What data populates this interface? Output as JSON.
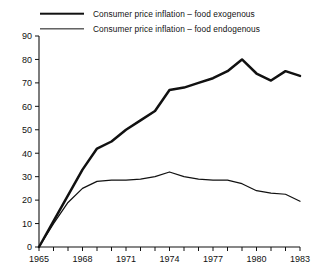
{
  "legend": {
    "position": "top",
    "items": [
      {
        "label": "Consumer price inflation – food exogenous",
        "style": "thick"
      },
      {
        "label": "Consumer price inflation – food endogenous",
        "style": "thin"
      }
    ]
  },
  "chart_data": {
    "type": "line",
    "title": "",
    "xlabel": "",
    "ylabel": "",
    "xlim": [
      1965,
      1983
    ],
    "ylim": [
      0,
      90
    ],
    "grid": false,
    "legend_position": "top",
    "ytick_labels": [
      "0",
      "10",
      "20",
      "30",
      "40",
      "50",
      "60",
      "70",
      "80",
      "90"
    ],
    "ytick_values": [
      0,
      10,
      20,
      30,
      40,
      50,
      60,
      70,
      80,
      90
    ],
    "xtick_values": [
      1965,
      1966,
      1967,
      1968,
      1969,
      1970,
      1971,
      1972,
      1973,
      1974,
      1975,
      1976,
      1977,
      1978,
      1979,
      1980,
      1981,
      1982,
      1983
    ],
    "xtick_labels": [
      "1965",
      "",
      "",
      "1968",
      "",
      "",
      "1971",
      "",
      "",
      "1974",
      "",
      "",
      "1977",
      "",
      "",
      "1980",
      "",
      "",
      "1983"
    ],
    "x": [
      1965,
      1966,
      1967,
      1968,
      1969,
      1970,
      1971,
      1972,
      1973,
      1974,
      1975,
      1976,
      1977,
      1978,
      1979,
      1980,
      1981,
      1982,
      1983
    ],
    "series": [
      {
        "name": "Consumer price inflation – food exogenous",
        "color": "#111111",
        "width": "thick",
        "values": [
          0,
          11,
          22,
          33,
          42,
          45,
          50,
          54,
          58,
          67,
          68,
          70,
          72,
          75,
          80,
          74,
          71,
          75,
          73
        ]
      },
      {
        "name": "Consumer price inflation – food endogenous",
        "color": "#111111",
        "width": "thin",
        "values": [
          0,
          10,
          19,
          25,
          28,
          28.5,
          28.5,
          29,
          30,
          32,
          30,
          29,
          28.5,
          28.5,
          27,
          24,
          23,
          22.5,
          19.5
        ]
      }
    ]
  }
}
